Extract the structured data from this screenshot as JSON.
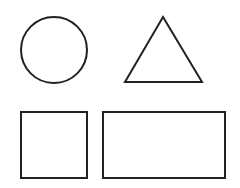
{
  "canvas": {
    "width": 240,
    "height": 188,
    "background": "#ffffff"
  },
  "style": {
    "stroke": "#222222",
    "stroke_width": 2,
    "fill": "none"
  },
  "shapes": [
    {
      "type": "circle",
      "name": "circle",
      "cx": 54,
      "cy": 50,
      "r": 33
    },
    {
      "type": "triangle",
      "name": "triangle",
      "points": "163,17 125,82 202,82"
    },
    {
      "type": "square",
      "name": "square",
      "x": 21,
      "y": 112,
      "width": 66,
      "height": 66
    },
    {
      "type": "rectangle",
      "name": "rectangle",
      "x": 103,
      "y": 112,
      "width": 122,
      "height": 66
    }
  ]
}
